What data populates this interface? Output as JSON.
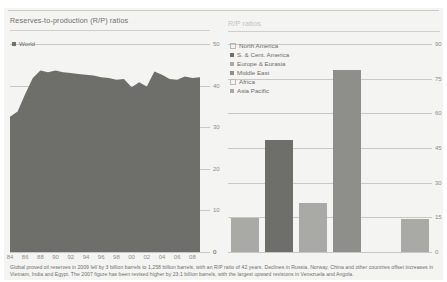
{
  "figure": {
    "left_panel_title": "Reserves-to-production (R/P) ratios",
    "right_panel_title": "R/P ratios",
    "caption": "Global proved oil reserves in 2009 fell by 3 billion barrels to 1,258 billion barrels, with an R/P ratio of 42 years. Declines in Russia, Norway, China and other countries offset increases in Vietnam, India and Egypt. The 2007 figure has been revised higher by 23.1 billion barrels, with the largest upward revisions in Venezuela and Angola."
  },
  "colors": {
    "area_fill": "#6e6e6b",
    "bar_dark": "#6e6e6b",
    "bar_light": "#a9a9a6",
    "grid": "#c7c7c3",
    "text": "#6d6d6a",
    "page": "#f4f4f2"
  },
  "chart_data": [
    {
      "type": "area",
      "title": "Reserves-to-production (R/P) ratios",
      "subtitle": "World",
      "xlabel": "",
      "ylabel": "",
      "ylim": [
        0,
        50
      ],
      "yticks": [
        0,
        10,
        20,
        30,
        40,
        50
      ],
      "grid": true,
      "legend": [
        {
          "label": "World",
          "color": "#6e6e6b",
          "filled": true
        }
      ],
      "x": [
        1984,
        1985,
        1986,
        1987,
        1988,
        1989,
        1990,
        1991,
        1992,
        1993,
        1994,
        1995,
        1996,
        1997,
        1998,
        1999,
        2000,
        2001,
        2002,
        2003,
        2004,
        2005,
        2006,
        2007,
        2008,
        2009
      ],
      "tick_labels": [
        "84",
        "86",
        "88",
        "90",
        "92",
        "94",
        "96",
        "98",
        "00",
        "02",
        "04",
        "06",
        "08"
      ],
      "tick_label_x": [
        1984,
        1986,
        1988,
        1990,
        1992,
        1994,
        1996,
        1998,
        2000,
        2002,
        2004,
        2006,
        2008
      ],
      "values": [
        32.5,
        33.8,
        38.0,
        41.8,
        43.6,
        43.2,
        43.6,
        43.2,
        43.0,
        42.8,
        42.6,
        42.4,
        42.0,
        41.8,
        41.4,
        41.6,
        39.6,
        40.8,
        39.8,
        43.4,
        42.6,
        41.6,
        41.4,
        42.2,
        41.8,
        42.0
      ]
    },
    {
      "type": "bar",
      "title": "R/P ratios",
      "xlabel": "",
      "ylabel": "",
      "ylim": [
        0,
        90
      ],
      "yticks": [
        0,
        15,
        30,
        45,
        60,
        75,
        90
      ],
      "grid": true,
      "categories": [
        "North America",
        "S. & Cent. America",
        "Europe & Eurasia",
        "Middle East",
        "Africa",
        "Asia Pacific"
      ],
      "values": [
        14.8,
        48.5,
        21.3,
        78.6,
        0,
        14.5
      ],
      "legend": [
        {
          "label": "North America",
          "color": "#a9a9a6",
          "filled": false
        },
        {
          "label": "S. & Cent. America",
          "color": "#6e6e6b",
          "filled": true
        },
        {
          "label": "Europe & Eurasia",
          "color": "#a9a9a6",
          "filled": true
        },
        {
          "label": "Middle East",
          "color": "#8e8e8b",
          "filled": true
        },
        {
          "label": "Africa",
          "color": "#c2c2bf",
          "filled": false
        },
        {
          "label": "Asia Pacific",
          "color": "#a9a9a6",
          "filled": true
        }
      ]
    }
  ]
}
